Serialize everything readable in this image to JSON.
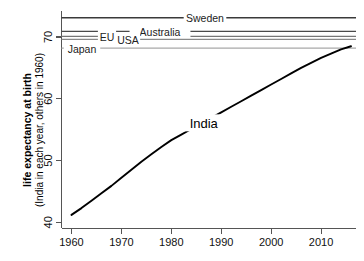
{
  "chart_data": {
    "type": "line",
    "title": "",
    "xlabel": "",
    "ylabel_line1": "life expectancy at birth",
    "ylabel_line2": "(India in each year, others in 1960)",
    "xlim": [
      1958,
      2017
    ],
    "ylim": [
      39.0,
      74.2
    ],
    "xticks": [
      1960,
      1970,
      1980,
      1990,
      2000,
      2010
    ],
    "xticklabels": [
      "1960",
      "1970",
      "1980",
      "1990",
      "2000",
      "2010"
    ],
    "yticks": [
      40,
      50,
      60,
      70
    ],
    "yticklabels": [
      "40",
      "50",
      "60",
      "70"
    ],
    "grid": false,
    "legend_position": "inline-annotations",
    "series": [
      {
        "name": "India",
        "label": "India",
        "type": "line",
        "color": "#000000",
        "x": [
          1960,
          1962,
          1964,
          1966,
          1968,
          1970,
          1972,
          1974,
          1976,
          1978,
          1980,
          1982,
          1984,
          1986,
          1988,
          1990,
          1992,
          1994,
          1996,
          1998,
          2000,
          2002,
          2004,
          2006,
          2008,
          2010,
          2012,
          2014,
          2016
        ],
        "values": [
          41.2,
          42.3,
          43.5,
          44.7,
          45.9,
          47.2,
          48.5,
          49.8,
          51.0,
          52.2,
          53.3,
          54.2,
          55.1,
          56.0,
          56.9,
          57.8,
          58.7,
          59.6,
          60.5,
          61.4,
          62.3,
          63.2,
          64.1,
          65.0,
          65.8,
          66.6,
          67.3,
          68.0,
          68.5
        ]
      }
    ],
    "reference_lines": [
      {
        "name": "Sweden",
        "label": "Sweden",
        "value": 73.1,
        "color": "#3a3a3a",
        "width": 1.5
      },
      {
        "name": "Australia",
        "label": "Australia",
        "value": 70.9,
        "color": "#4a4a4a",
        "width": 1.3
      },
      {
        "name": "EU",
        "label": "EU",
        "value": 70.1,
        "color": "#777777",
        "width": 1.2
      },
      {
        "name": "USA",
        "label": "USA",
        "value": 69.6,
        "color": "#8a8a8a",
        "width": 1.2
      },
      {
        "name": "Japan",
        "label": "Japan",
        "value": 68.2,
        "color": "#a8a8a8",
        "width": 1.2
      }
    ]
  }
}
